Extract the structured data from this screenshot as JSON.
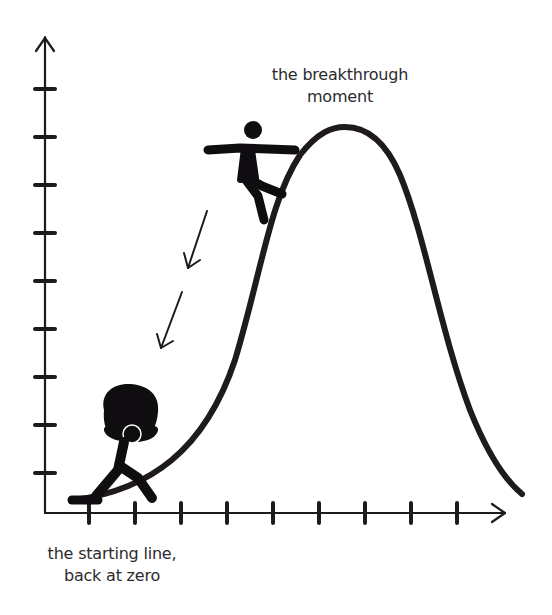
{
  "diagram": {
    "type": "concept-curve",
    "colors": {
      "ink": "#1f1a1e",
      "text": "#2b2a2e",
      "background": "#ffffff"
    },
    "axes": {
      "y_ticks": 9,
      "x_ticks": 9,
      "y_arrow": "up-arrow",
      "x_arrow": "right-arrow",
      "tick_labels": []
    },
    "curve": {
      "shape": "bell-curve",
      "start": "bottom-left",
      "peak": "upper-middle-right",
      "end": "bottom-right"
    },
    "labels": {
      "peak_line1": "the breakthrough",
      "peak_line2": "moment",
      "start_line1": "the starting line,",
      "start_line2": "back at zero"
    },
    "figures": [
      {
        "name": "climbing-figure",
        "description": "figure clinging to the rising curve near the peak"
      },
      {
        "name": "slumped-figure",
        "description": "figure with head in hands sitting at the start of the curve"
      }
    ],
    "arrows": [
      {
        "name": "fall-arrow-1",
        "direction": "down-left"
      },
      {
        "name": "fall-arrow-2",
        "direction": "down-left"
      }
    ]
  }
}
